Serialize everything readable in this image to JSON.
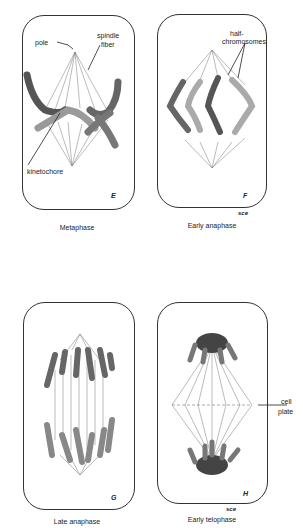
{
  "panels": [
    {
      "id": "E",
      "letter": "E",
      "caption": "Metaphase",
      "labels": {
        "pole": "pole",
        "spindle": "spindle",
        "fiber": "fiber",
        "kinetochore": "kinetochore"
      }
    },
    {
      "id": "F",
      "letter": "F",
      "caption": "Early anaphase",
      "labels": {
        "half": "half-",
        "chromosomes": "chromosomes"
      }
    },
    {
      "id": "G",
      "letter": "G",
      "caption": "Late anaphase"
    },
    {
      "id": "H",
      "letter": "H",
      "caption": "Early telophase",
      "labels": {
        "cell": "cell",
        "plate": "plate"
      }
    }
  ],
  "signature": "sce",
  "colors": {
    "outline": "#333333",
    "chromosome_dark": "#555555",
    "chromosome_light": "#9a9a9a",
    "fiber": "#777777"
  }
}
